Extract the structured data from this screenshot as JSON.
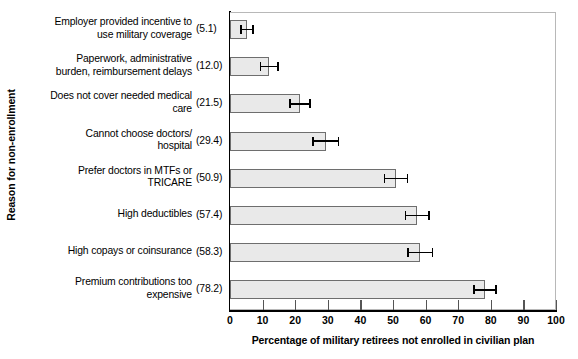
{
  "chart_data": {
    "type": "bar",
    "orientation": "horizontal",
    "title": "",
    "xlabel": "Percentage of military retirees not enrolled in civilian plan",
    "ylabel": "Reason for non-enrollment",
    "xlim": [
      0,
      100
    ],
    "xticks": [
      0,
      10,
      20,
      30,
      40,
      50,
      60,
      70,
      80,
      90,
      100
    ],
    "grid": false,
    "legend": null,
    "value_label_format": "(v)",
    "error_bars": true,
    "categories": [
      "Employer provided incentive to\nuse military coverage",
      "Paperwork, administrative\nburden, reimbursement delays",
      "Does not cover needed medical\ncare",
      "Cannot choose doctors/\nhospital",
      "Prefer doctors in MTFs or\nTRICARE",
      "High deductibles",
      "High copays or coinsurance",
      "Premium contributions too\nexpensive"
    ],
    "values": [
      5.1,
      12.0,
      21.5,
      29.4,
      50.9,
      57.4,
      58.3,
      78.2
    ],
    "value_labels": [
      "(5.1)",
      "(12.0)",
      "(21.5)",
      "(29.4)",
      "(50.9)",
      "(57.4)",
      "(58.3)",
      "(78.2)"
    ],
    "error_low": [
      3.3,
      9.3,
      18.4,
      25.5,
      47.4,
      53.8,
      54.6,
      74.8
    ],
    "error_high": [
      7.0,
      14.8,
      24.6,
      33.3,
      54.5,
      61.0,
      62.1,
      81.6
    ],
    "bar_fill_color": "#e9e9e9",
    "bar_edge_color": "#6e6e6e",
    "error_bar_color": "#000000"
  }
}
